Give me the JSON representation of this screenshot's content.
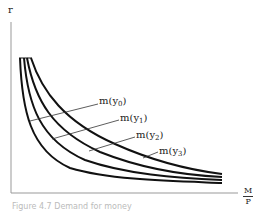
{
  "diagram": {
    "type": "money-demand-curves",
    "y_axis_label": "r",
    "x_axis_label": {
      "numerator": "M",
      "denominator": "P"
    },
    "curves": [
      {
        "label": "m(y",
        "subscript": "0",
        "order": 0
      },
      {
        "label": "m(y",
        "subscript": "1",
        "order": 1
      },
      {
        "label": "m(y",
        "subscript": "2",
        "order": 2
      },
      {
        "label": "m(y",
        "subscript": "3",
        "order": 3
      }
    ],
    "caption": "Figure 4.7 Demand for money",
    "colors": {
      "curve": "#111111",
      "axis": "#999999",
      "leader": "#333333"
    }
  }
}
